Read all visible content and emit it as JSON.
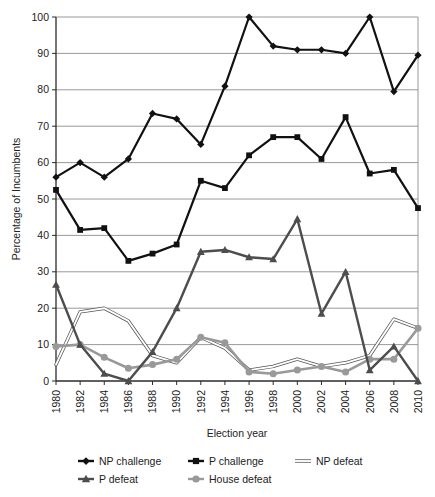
{
  "chart_data": {
    "type": "line",
    "title": "",
    "xlabel": "Election year",
    "ylabel": "Percentage of Incumbents",
    "xlim": [
      1980,
      2010
    ],
    "ylim": [
      0,
      100
    ],
    "grid": true,
    "legend_position": "bottom",
    "categories": [
      1980,
      1982,
      1984,
      1986,
      1988,
      1990,
      1992,
      1994,
      1996,
      1998,
      2000,
      2002,
      2004,
      2006,
      2008,
      2010
    ],
    "x_tick_labels": [
      "1980",
      "1982",
      "1984",
      "1986",
      "1988",
      "1990",
      "1992",
      "1994",
      "1996",
      "1998",
      "2000",
      "2002",
      "2004",
      "2006",
      "2008",
      "2010"
    ],
    "y_tick_labels": [
      "0",
      "10",
      "20",
      "30",
      "40",
      "50",
      "60",
      "70",
      "80",
      "90",
      "100"
    ],
    "y_ticks": [
      0,
      10,
      20,
      30,
      40,
      50,
      60,
      70,
      80,
      90,
      100
    ],
    "series": [
      {
        "name": "NP challenge",
        "marker": "diamond",
        "color": "#111111",
        "values": [
          56,
          60,
          56,
          61,
          73.5,
          72,
          65,
          81,
          100,
          92,
          91,
          91,
          90,
          100,
          79.5,
          89.5
        ]
      },
      {
        "name": "P challenge",
        "marker": "square",
        "color": "#111111",
        "values": [
          52.5,
          41.5,
          42,
          33,
          35,
          37.5,
          55,
          53,
          62,
          67,
          67,
          61,
          72.5,
          57,
          58,
          47.5
        ]
      },
      {
        "name": "NP defeat",
        "marker": "line",
        "color": "#ffffff",
        "outline": "#555555",
        "values": [
          4.5,
          19,
          20,
          16.5,
          7,
          5,
          12,
          9,
          3,
          4,
          6,
          4,
          5,
          7,
          17,
          14.5
        ]
      },
      {
        "name": "P defeat",
        "marker": "triangle",
        "color": "#4d4d4d",
        "values": [
          26.5,
          10,
          2,
          0,
          8,
          20,
          35.5,
          36,
          34,
          33.5,
          44.5,
          18.5,
          30,
          3,
          9.5,
          0
        ]
      },
      {
        "name": "House defeat",
        "marker": "circle",
        "color": "#999999",
        "values": [
          9.5,
          10,
          6.5,
          3.5,
          4.5,
          6,
          12,
          10.5,
          2.5,
          2,
          3,
          4,
          2.5,
          6,
          6,
          14.5
        ]
      }
    ]
  },
  "legend": {
    "items": [
      {
        "label": "NP challenge",
        "marker": "diamond"
      },
      {
        "label": "P challenge",
        "marker": "square"
      },
      {
        "label": "NP defeat",
        "marker": "line"
      },
      {
        "label": "P defeat",
        "marker": "triangle"
      },
      {
        "label": "House defeat",
        "marker": "circle"
      }
    ]
  },
  "axes": {
    "x_title": "Election year",
    "y_title": "Percentage of Incumbents"
  }
}
